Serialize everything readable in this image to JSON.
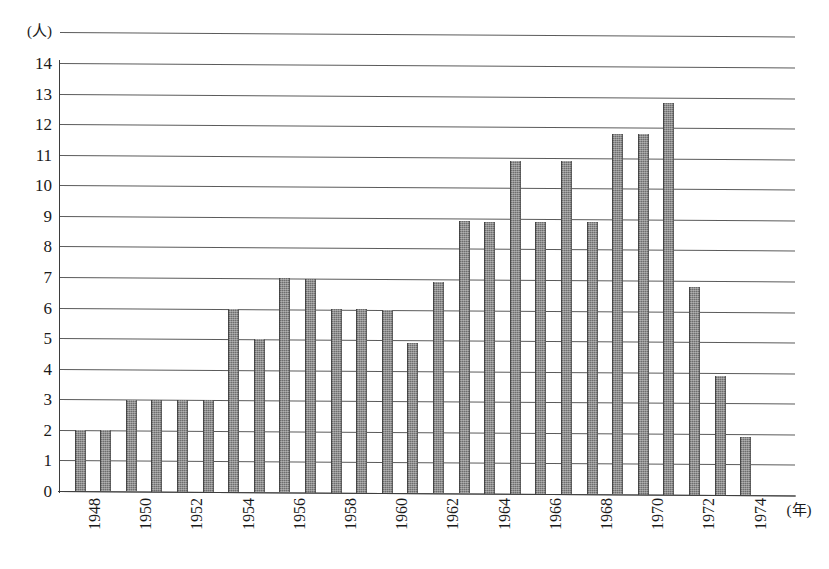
{
  "chart_data": {
    "type": "bar",
    "title": "",
    "subtitle": "",
    "xlabel": "(年)",
    "ylabel": "(人)",
    "ylim": [
      0,
      14
    ],
    "y_ticks": [
      0,
      1,
      2,
      3,
      4,
      5,
      6,
      7,
      8,
      9,
      10,
      11,
      12,
      13,
      14
    ],
    "y_tick_labels": [
      "0",
      "1",
      "2",
      "3",
      "4",
      "5",
      "6",
      "7",
      "8",
      "9",
      "10",
      "11",
      "12",
      "13",
      "14"
    ],
    "grid": true,
    "legend": null,
    "bar_color": "#6e6e6e",
    "categories": [
      "1948",
      "1949",
      "1950",
      "1951",
      "1952",
      "1953",
      "1954",
      "1955",
      "1956",
      "1957",
      "1958",
      "1959",
      "1960",
      "1961",
      "1962",
      "1963",
      "1964",
      "1965",
      "1966",
      "1967",
      "1968",
      "1969",
      "1970",
      "1971",
      "1972",
      "1973",
      "1974",
      "1975"
    ],
    "x_tick_labels": [
      "1948",
      "",
      "1950",
      "",
      "1952",
      "",
      "1954",
      "",
      "1956",
      "",
      "1958",
      "",
      "1960",
      "",
      "1962",
      "",
      "1964",
      "",
      "1966",
      "",
      "1968",
      "",
      "1970",
      "",
      "1972",
      "",
      "1974",
      ""
    ],
    "values": [
      2,
      2,
      3,
      3,
      3,
      3,
      6,
      5,
      7,
      7,
      6,
      6,
      6,
      4.9,
      6.9,
      8.9,
      8.9,
      10.9,
      8.9,
      10.9,
      8.9,
      11.8,
      11.8,
      12.8,
      6.8,
      3.9,
      1.9,
      0
    ],
    "bar_values_by_year": [
      {
        "year": "1948",
        "value": 2
      },
      {
        "year": "1949",
        "value": 2
      },
      {
        "year": "1950",
        "value": 3
      },
      {
        "year": "1951",
        "value": 3
      },
      {
        "year": "1952",
        "value": 3
      },
      {
        "year": "1953",
        "value": 3
      },
      {
        "year": "1954",
        "value": 6
      },
      {
        "year": "1955",
        "value": 5
      },
      {
        "year": "1956",
        "value": 7
      },
      {
        "year": "1957",
        "value": 7
      },
      {
        "year": "1958",
        "value": 6
      },
      {
        "year": "1959",
        "value": 6
      },
      {
        "year": "1960",
        "value": 6
      },
      {
        "year": "1961",
        "value": 4.9
      },
      {
        "year": "1962",
        "value": 6.9
      },
      {
        "year": "1963",
        "value": 8.9
      },
      {
        "year": "1964",
        "value": 8.9
      },
      {
        "year": "1965",
        "value": 10.9
      },
      {
        "year": "1966",
        "value": 8.9
      },
      {
        "year": "1967",
        "value": 10.9
      },
      {
        "year": "1968",
        "value": 8.9
      },
      {
        "year": "1969",
        "value": 11.8
      },
      {
        "year": "1970",
        "value": 11.8
      },
      {
        "year": "1971",
        "value": 12.8
      },
      {
        "year": "1972",
        "value": 6.8
      },
      {
        "year": "1973",
        "value": 3.9
      },
      {
        "year": "1974",
        "value": 1.9
      },
      {
        "year": "1975",
        "value": 0
      }
    ]
  }
}
